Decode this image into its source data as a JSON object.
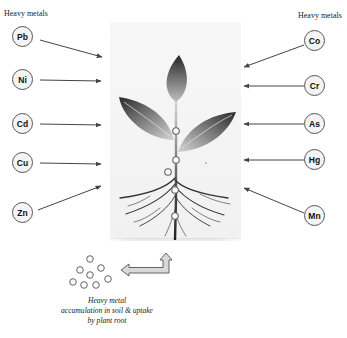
{
  "diagram": {
    "title_left": "Heavy metals",
    "title_right": "Heavy metals",
    "left_metals": [
      {
        "symbol": "Pb",
        "x": 23,
        "y": 37
      },
      {
        "symbol": "Ni",
        "x": 23,
        "y": 80
      },
      {
        "symbol": "Cd",
        "x": 23,
        "y": 124
      },
      {
        "symbol": "Cu",
        "x": 23,
        "y": 163
      },
      {
        "symbol": "Zn",
        "x": 23,
        "y": 213
      }
    ],
    "right_metals": [
      {
        "symbol": "Co",
        "x": 321,
        "y": 41
      },
      {
        "symbol": "Cr",
        "x": 321,
        "y": 86
      },
      {
        "symbol": "As",
        "x": 321,
        "y": 124
      },
      {
        "symbol": "Hg",
        "x": 321,
        "y": 160
      },
      {
        "symbol": "Mn",
        "x": 321,
        "y": 216
      }
    ],
    "center_image": "plant-with-roots",
    "caption_lines": [
      "Heavy metal",
      "accumulation in soil & uptake",
      "by plant root"
    ],
    "colors": {
      "arrow": "#444444",
      "circle_border": "#555555",
      "leaf_dark": "#2e2e2e",
      "leaf_light": "#cfcfcf",
      "panel_bg": "#f4f4f4"
    }
  }
}
